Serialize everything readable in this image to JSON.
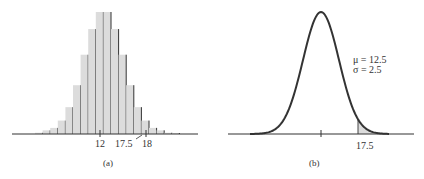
{
  "chart_data": [
    {
      "type": "bar",
      "panel": "(a)",
      "title": "",
      "description": "Symmetric histogram (binomial-like distribution) with vertical lines at bar boundaries",
      "x_tick_labels": [
        "12",
        "17.5",
        "18"
      ],
      "bars_relative_height": [
        0.01,
        0.03,
        0.05,
        0.11,
        0.22,
        0.4,
        0.65,
        0.86,
        1.0,
        1.0,
        0.86,
        0.65,
        0.4,
        0.22,
        0.11,
        0.05,
        0.03,
        0.01,
        0.005
      ],
      "bar_color": "#dcdcdc",
      "xlabel": "",
      "ylabel": "",
      "grid": false,
      "caption": "(a)"
    },
    {
      "type": "area",
      "panel": "(b)",
      "title": "",
      "description": "Normal density curve with shaded right tail beyond 17.5",
      "annotations": [
        "μ = 12.5",
        "σ = 2.5"
      ],
      "mu": 12.5,
      "sigma": 2.5,
      "shaded_from": 17.5,
      "x_tick_labels": [
        "17.5"
      ],
      "shade_color": "#dcdcdc",
      "grid": false,
      "caption": "(b)"
    }
  ],
  "panel_a": {
    "ticks": {
      "t12": "12",
      "t175": "17.5",
      "t18": "18"
    },
    "caption": "(a)"
  },
  "panel_b": {
    "mu_label": "μ = 12.5",
    "sigma_label": "σ = 2.5",
    "tick": "17.5",
    "caption": "(b)"
  }
}
